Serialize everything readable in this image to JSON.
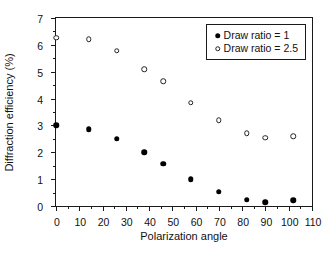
{
  "chart_data": {
    "type": "scatter",
    "title": "",
    "xlabel": "Polarization angle",
    "ylabel": "Diffraction efficiency (%)",
    "xlim": [
      0,
      110
    ],
    "ylim": [
      0,
      7
    ],
    "xticks": [
      0,
      10,
      20,
      30,
      40,
      50,
      60,
      70,
      80,
      90,
      100,
      110
    ],
    "yticks": [
      0,
      1,
      2,
      3,
      4,
      5,
      6,
      7
    ],
    "grid": false,
    "legend_position": "top-right",
    "series": [
      {
        "name": "Draw ratio = 1",
        "marker": "filled-circle",
        "color": "#000000",
        "x": [
          0,
          14,
          26,
          38,
          46,
          58,
          70,
          82,
          90,
          102
        ],
        "y": [
          3.0,
          2.85,
          2.5,
          2.0,
          1.58,
          1.0,
          0.53,
          0.23,
          0.14,
          0.22
        ]
      },
      {
        "name": "Draw ratio = 2.5",
        "marker": "open-circle",
        "color": "#222222",
        "x": [
          0,
          14,
          26,
          38,
          46,
          58,
          70,
          82,
          90,
          102
        ],
        "y": [
          6.27,
          6.2,
          5.78,
          5.1,
          4.65,
          3.85,
          3.2,
          2.7,
          2.55,
          2.6
        ]
      }
    ]
  },
  "legend": {
    "entries": [
      {
        "label": "Draw ratio = 1"
      },
      {
        "label": "Draw ratio = 2.5"
      }
    ]
  },
  "axes": {
    "x_title": "Polarization angle",
    "y_title": "Diffraction efficiency (%)",
    "x_tick_labels": [
      "0",
      "10",
      "20",
      "30",
      "40",
      "50",
      "60",
      "70",
      "80",
      "90",
      "100",
      "110"
    ],
    "y_tick_labels": [
      "0",
      "1",
      "2",
      "3",
      "4",
      "5",
      "6",
      "7"
    ]
  }
}
